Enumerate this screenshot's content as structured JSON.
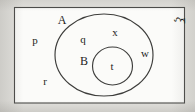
{
  "figure": {
    "kind": "venn-diagram",
    "universal_set": {
      "symbol": "ξ",
      "rotated": true
    },
    "sets": [
      {
        "id": "A",
        "label": "A",
        "shape": "ellipse"
      },
      {
        "id": "B",
        "label": "B",
        "shape": "ellipse"
      }
    ],
    "elements": [
      {
        "label": "p",
        "region": "outside A and B"
      },
      {
        "label": "r",
        "region": "outside A and B"
      },
      {
        "label": "q",
        "region": "in A only"
      },
      {
        "label": "x",
        "region": "in A only"
      },
      {
        "label": "w",
        "region": "in A only"
      },
      {
        "label": "t",
        "region": "in B"
      }
    ],
    "colors": {
      "page_background": "#e3e2de",
      "rect_fill": "#fbfbf9",
      "stroke": "#3d3d3b",
      "text": "#1e1e1c"
    },
    "labels": {
      "set_a": "A",
      "set_b": "B",
      "universal": "ξ",
      "elem_p": "p",
      "elem_q": "q",
      "elem_r": "r",
      "elem_t": "t",
      "elem_w": "w",
      "elem_x": "x"
    }
  }
}
